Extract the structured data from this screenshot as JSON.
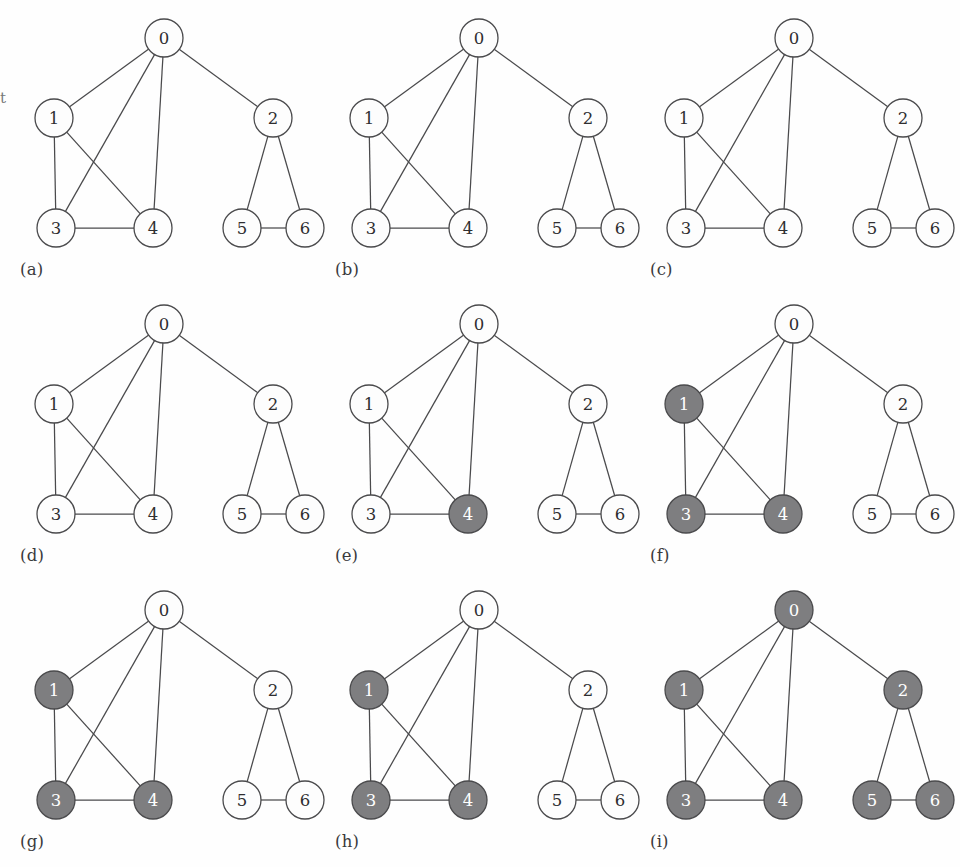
{
  "figure": {
    "margin_fragment_text": "t",
    "node_fill_plain": "#fdfdfd",
    "node_fill_shaded": "#7e7e80",
    "node_stroke": "#4a4a4c",
    "node_label_plain": "#2e2e30",
    "node_label_shaded": "#ffffff",
    "edge_color": "#4a4a4c"
  },
  "graph": {
    "node_ids": [
      "0",
      "1",
      "2",
      "3",
      "4",
      "5",
      "6"
    ],
    "node_positions": {
      "0": [
        150,
        30
      ],
      "1": [
        40,
        110
      ],
      "2": [
        259,
        110
      ],
      "3": [
        42,
        220
      ],
      "4": [
        139,
        220
      ],
      "5": [
        228,
        220
      ],
      "6": [
        291,
        220
      ]
    },
    "node_radius": 19,
    "edges": [
      [
        "0",
        "1"
      ],
      [
        "0",
        "2"
      ],
      [
        "0",
        "3"
      ],
      [
        "0",
        "4"
      ],
      [
        "1",
        "3"
      ],
      [
        "1",
        "4"
      ],
      [
        "3",
        "4"
      ],
      [
        "2",
        "5"
      ],
      [
        "2",
        "6"
      ],
      [
        "5",
        "6"
      ]
    ]
  },
  "panels": [
    {
      "label": "(a)",
      "name": "panel-a",
      "shaded": []
    },
    {
      "label": "(b)",
      "name": "panel-b",
      "shaded": []
    },
    {
      "label": "(c)",
      "name": "panel-c",
      "shaded": []
    },
    {
      "label": "(d)",
      "name": "panel-d",
      "shaded": []
    },
    {
      "label": "(e)",
      "name": "panel-e",
      "shaded": [
        "4"
      ]
    },
    {
      "label": "(f)",
      "name": "panel-f",
      "shaded": [
        "1",
        "3",
        "4"
      ]
    },
    {
      "label": "(g)",
      "name": "panel-g",
      "shaded": [
        "1",
        "3",
        "4"
      ]
    },
    {
      "label": "(h)",
      "name": "panel-h",
      "shaded": [
        "1",
        "3",
        "4"
      ]
    },
    {
      "label": "(i)",
      "name": "panel-i",
      "shaded": [
        "0",
        "1",
        "2",
        "3",
        "4",
        "5",
        "6"
      ]
    }
  ],
  "chart_data": {
    "type": "diagram",
    "title": "",
    "subtitle": "",
    "nodes": [
      "0",
      "1",
      "2",
      "3",
      "4",
      "5",
      "6"
    ],
    "edges": [
      [
        "0",
        "1"
      ],
      [
        "0",
        "2"
      ],
      [
        "0",
        "3"
      ],
      [
        "0",
        "4"
      ],
      [
        "1",
        "3"
      ],
      [
        "1",
        "4"
      ],
      [
        "3",
        "4"
      ],
      [
        "2",
        "5"
      ],
      [
        "2",
        "6"
      ],
      [
        "5",
        "6"
      ]
    ],
    "panel_labels": [
      "(a)",
      "(b)",
      "(c)",
      "(d)",
      "(e)",
      "(f)",
      "(g)",
      "(h)",
      "(i)"
    ],
    "shaded_nodes_per_panel": [
      [],
      [],
      [],
      [],
      [
        "4"
      ],
      [
        "1",
        "3",
        "4"
      ],
      [
        "1",
        "3",
        "4"
      ],
      [
        "1",
        "3",
        "4"
      ],
      [
        "0",
        "1",
        "2",
        "3",
        "4",
        "5",
        "6"
      ]
    ],
    "layout": {
      "rows": 3,
      "cols": 3,
      "legend": "none",
      "grid": false
    }
  }
}
